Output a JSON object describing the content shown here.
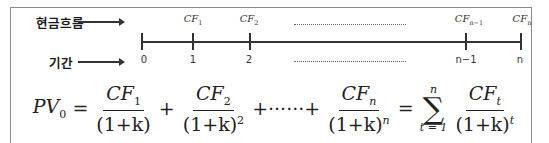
{
  "labels": {
    "cash_flow": "현금흐름",
    "period": "기간"
  },
  "timeline": {
    "cash_flows": [
      {
        "base": "CF",
        "sub": "1"
      },
      {
        "base": "CF",
        "sub": "2"
      },
      {
        "base": "CF",
        "sub": "n−1"
      },
      {
        "base": "CF",
        "sub": "n"
      }
    ],
    "periods": [
      "0",
      "1",
      "2",
      "n−1",
      "n"
    ]
  },
  "formula": {
    "lhs": "PV",
    "lhs_sub": "0",
    "eq": "=",
    "term1_num": "CF",
    "term1_num_sub": "1",
    "term1_den": "(1+k)",
    "plus1": "+",
    "term2_num": "CF",
    "term2_num_sub": "2",
    "term2_den": "(1+k)",
    "term2_den_sup": "2",
    "ellipsis": "+······+",
    "termn_num": "CF",
    "termn_num_sub": "n",
    "termn_den": "(1+k)",
    "termn_den_sup": "n",
    "eq2": "=",
    "sum_symbol": "∑",
    "sum_upper": "n",
    "sum_lower": "t = 1",
    "termt_num": "CF",
    "termt_num_sub": "t",
    "termt_den": "(1+k)",
    "termt_den_sup": "t"
  }
}
